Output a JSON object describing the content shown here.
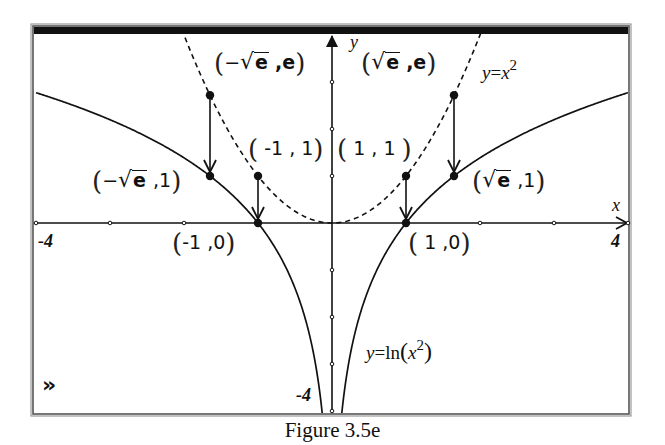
{
  "figure": {
    "caption": "Figure 3.5e",
    "nav_icon": "»",
    "nav_icon_name": "double-chevron-right-icon"
  },
  "colors": {
    "ink": "#111111",
    "frame_gray": "#9a9a9a",
    "background": "#ffffff"
  },
  "frame": {
    "left": 34,
    "top": 27,
    "right": 628,
    "bottom": 413,
    "title_bar_height": 7
  },
  "axes": {
    "origin_px": [
      332,
      223
    ],
    "x_unit_px": 74,
    "y_unit_px": 47,
    "x_label": "x",
    "y_label": "y",
    "x_min_label": "-4",
    "x_max_label": "4",
    "y_min_label": "-4"
  },
  "labels": {
    "parabola": {
      "lhs": "y",
      "eq": "=",
      "var": "x",
      "exp": "2"
    },
    "log": {
      "lhs": "y",
      "eq": "=ln",
      "open": "(",
      "var": "x",
      "exp": "2",
      "close": ")"
    },
    "points": [
      {
        "id": "neg-sqrt-e-e",
        "text": "(−√e, e)",
        "pre": "−",
        "sqrt": "e",
        "post": ",e"
      },
      {
        "id": "pos-sqrt-e-e",
        "text": "(√e, e)",
        "pre": "",
        "sqrt": "e",
        "post": ",e"
      },
      {
        "id": "neg-one-one",
        "text": "(-1, 1)",
        "plain": "-1 , 1"
      },
      {
        "id": "pos-one-one",
        "text": "(1, 1)",
        "plain": "1 , 1"
      },
      {
        "id": "neg-sqrt-e-one",
        "text": "(−√e, 1)",
        "pre": "−",
        "sqrt": "e",
        "post": ",1"
      },
      {
        "id": "pos-sqrt-e-one",
        "text": "(√e, 1)",
        "pre": "",
        "sqrt": "e",
        "post": ",1"
      },
      {
        "id": "neg-one-zero",
        "text": "(-1, 0)",
        "plain": "-1 ,0"
      },
      {
        "id": "pos-one-zero",
        "text": "(1, 0)",
        "plain": "1 ,0"
      }
    ]
  },
  "chart_data": {
    "type": "line",
    "title": "Figure 3.5e",
    "xlabel": "x",
    "ylabel": "y",
    "xlim": [
      -4,
      4
    ],
    "ylim": [
      -4,
      4.17
    ],
    "x_ticks": [
      -4,
      -3,
      -2,
      -1,
      0,
      1,
      2,
      3,
      4
    ],
    "y_ticks": [
      -4,
      -3,
      -2,
      -1,
      0,
      1,
      2,
      3,
      4
    ],
    "grid": false,
    "series": [
      {
        "name": "y=x^2",
        "function": "x^2",
        "style": "dashed",
        "x_range": [
          -2.04,
          2.04
        ]
      },
      {
        "name": "y=ln(x^2)",
        "function": "ln(x^2)",
        "style": "solid",
        "x_range": [
          -4,
          4
        ],
        "asymptote_x": 0
      }
    ],
    "points": [
      {
        "label": "(-√e, e)",
        "x": -1.6487,
        "y": 2.7183
      },
      {
        "label": "(√e, e)",
        "x": 1.6487,
        "y": 2.7183
      },
      {
        "label": "(-1, 1)",
        "x": -1,
        "y": 1
      },
      {
        "label": "(1, 1)",
        "x": 1,
        "y": 1
      },
      {
        "label": "(-√e, 1)",
        "x": -1.6487,
        "y": 1
      },
      {
        "label": "(√e, 1)",
        "x": 1.6487,
        "y": 1
      },
      {
        "label": "(-1, 0)",
        "x": -1,
        "y": 0
      },
      {
        "label": "(1, 0)",
        "x": 1,
        "y": 0
      }
    ],
    "arrows": [
      {
        "from": [
          -1.6487,
          2.7183
        ],
        "to": [
          -1.6487,
          1
        ]
      },
      {
        "from": [
          1.6487,
          2.7183
        ],
        "to": [
          1.6487,
          1
        ]
      },
      {
        "from": [
          -1,
          1
        ],
        "to": [
          -1,
          0
        ]
      },
      {
        "from": [
          1,
          1
        ],
        "to": [
          1,
          0
        ]
      }
    ],
    "annotations": [
      "y=x^2",
      "y=ln(x^2)",
      "-4",
      "4",
      "-4"
    ]
  }
}
